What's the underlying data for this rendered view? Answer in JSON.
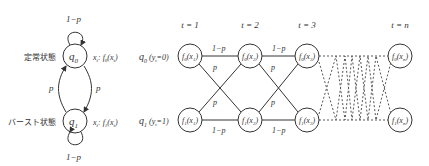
{
  "state_diagram": {
    "states": [
      {
        "id": "q0",
        "name": "q",
        "sub": "0",
        "label": "定常状態",
        "emission": "x",
        "emission_sub": "t",
        "emission_fn": "f",
        "emission_fn_sub": "0",
        "emission_arg": "x",
        "emission_arg_sub": "t"
      },
      {
        "id": "q1",
        "name": "q",
        "sub": "1",
        "label": "バースト状態",
        "emission": "x",
        "emission_sub": "t",
        "emission_fn": "f",
        "emission_fn_sub": "1",
        "emission_arg": "x",
        "emission_arg_sub": "t"
      }
    ],
    "self_loop_label_top": "1−p",
    "self_loop_label_bottom": "1−p",
    "transition_label_left": "p",
    "transition_label_right": "p"
  },
  "trellis": {
    "time_labels": [
      "t = 1",
      "t = 2",
      "t = 3",
      "t = n"
    ],
    "row_labels": [
      {
        "q": "q",
        "q_sub": "0",
        "cond": "(y",
        "cond_sub": "t",
        "cond_val": "=0)"
      },
      {
        "q": "q",
        "q_sub": "1",
        "cond": "(y",
        "cond_sub": "t",
        "cond_val": "=1)"
      }
    ],
    "nodes_top": [
      {
        "fn": "f",
        "fn_sub": "0",
        "arg": "x",
        "arg_sub": "1"
      },
      {
        "fn": "f",
        "fn_sub": "0",
        "arg": "x",
        "arg_sub": "2"
      },
      {
        "fn": "f",
        "fn_sub": "0",
        "arg": "x",
        "arg_sub": "3"
      },
      {
        "fn": "f",
        "fn_sub": "0",
        "arg": "x",
        "arg_sub": "n"
      }
    ],
    "nodes_bottom": [
      {
        "fn": "f",
        "fn_sub": "1",
        "arg": "x",
        "arg_sub": "1"
      },
      {
        "fn": "f",
        "fn_sub": "1",
        "arg": "x",
        "arg_sub": "2"
      },
      {
        "fn": "f",
        "fn_sub": "1",
        "arg": "x",
        "arg_sub": "3"
      },
      {
        "fn": "f",
        "fn_sub": "1",
        "arg": "x",
        "arg_sub": "n"
      }
    ],
    "edge_labels": {
      "stay": "1−p",
      "switch": "p"
    }
  }
}
